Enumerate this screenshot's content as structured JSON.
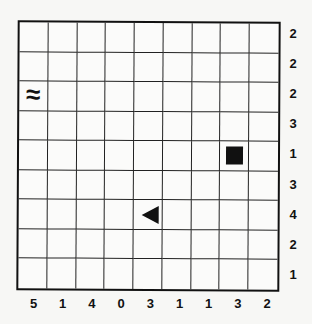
{
  "puzzle": {
    "type": "battleships",
    "rows": 9,
    "cols": 9,
    "row_clues": [
      "2",
      "2",
      "2",
      "3",
      "1",
      "3",
      "4",
      "2",
      "1"
    ],
    "col_clues": [
      "5",
      "1",
      "4",
      "0",
      "3",
      "1",
      "1",
      "3",
      "2"
    ],
    "given_cells": [
      {
        "row": 2,
        "col": 0,
        "kind": "water",
        "glyph": "≈"
      },
      {
        "row": 4,
        "col": 7,
        "kind": "ship-middle-square"
      },
      {
        "row": 6,
        "col": 4,
        "kind": "ship-end-left-triangle"
      }
    ]
  }
}
